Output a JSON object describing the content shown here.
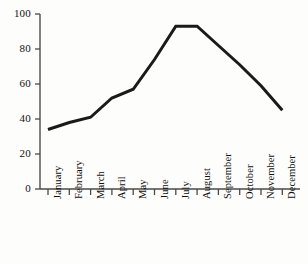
{
  "chart_data": {
    "type": "line",
    "title": "",
    "xlabel": "",
    "ylabel": "",
    "categories": [
      "January",
      "February",
      "March",
      "April",
      "May",
      "June",
      "July",
      "August",
      "September",
      "October",
      "November",
      "December"
    ],
    "values": [
      34,
      38,
      41,
      52,
      57,
      74,
      93,
      93,
      82,
      71,
      59,
      45
    ],
    "series": [
      {
        "name": "",
        "values": [
          34,
          38,
          41,
          52,
          57,
          74,
          93,
          93,
          82,
          71,
          59,
          45
        ]
      }
    ],
    "ylim": [
      0,
      100
    ],
    "yticks": [
      0,
      20,
      40,
      60,
      80,
      100
    ],
    "ytick_labels": [
      "0",
      "20",
      "40",
      "60",
      "80",
      "100"
    ],
    "xtick_labels": [
      "January",
      "February",
      "March",
      "April",
      "May",
      "June",
      "July",
      "August",
      "September",
      "October",
      "November",
      "December"
    ],
    "grid": false,
    "legend": null,
    "legend_position": "none",
    "line_color": "#1a1a1a",
    "line_width": 3,
    "markers": false,
    "axis_color": "#4a4a4a",
    "background": "#fdfdfc",
    "xtick_rotation": -90
  }
}
